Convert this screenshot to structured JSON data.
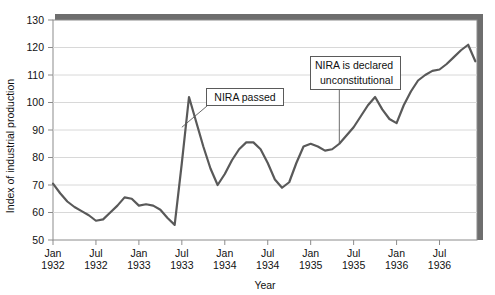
{
  "chart_data": {
    "type": "line",
    "title": "",
    "xlabel": "Year",
    "ylabel": "Index of industrial production",
    "ylim": [
      50,
      130
    ],
    "yticks": [
      50,
      60,
      70,
      80,
      90,
      100,
      110,
      120,
      130
    ],
    "grid": true,
    "legend": "none",
    "xtick_labels": [
      {
        "line1": "Jan",
        "line2": "1932"
      },
      {
        "line1": "Jul",
        "line2": "1932"
      },
      {
        "line1": "Jan",
        "line2": "1933"
      },
      {
        "line1": "Jul",
        "line2": "1933"
      },
      {
        "line1": "Jan",
        "line2": "1934"
      },
      {
        "line1": "Jul",
        "line2": "1934"
      },
      {
        "line1": "Jan",
        "line2": "1935"
      },
      {
        "line1": "Jul",
        "line2": "1935"
      },
      {
        "line1": "Jan",
        "line2": "1936"
      },
      {
        "line1": "Jul",
        "line2": "1936"
      }
    ],
    "x": [
      "1932-01",
      "1932-02",
      "1932-03",
      "1932-04",
      "1932-05",
      "1932-06",
      "1932-07",
      "1932-08",
      "1932-09",
      "1932-10",
      "1932-11",
      "1932-12",
      "1933-01",
      "1933-02",
      "1933-03",
      "1933-04",
      "1933-05",
      "1933-06",
      "1933-07",
      "1933-08",
      "1933-09",
      "1933-10",
      "1933-11",
      "1933-12",
      "1934-01",
      "1934-02",
      "1934-03",
      "1934-04",
      "1934-05",
      "1934-06",
      "1934-07",
      "1934-08",
      "1934-09",
      "1934-10",
      "1934-11",
      "1934-12",
      "1935-01",
      "1935-02",
      "1935-03",
      "1935-04",
      "1935-05",
      "1935-06",
      "1935-07",
      "1935-08",
      "1935-09",
      "1935-10",
      "1935-11",
      "1935-12",
      "1936-01",
      "1936-02",
      "1936-03",
      "1936-04",
      "1936-05",
      "1936-06",
      "1936-07",
      "1936-08",
      "1936-09",
      "1936-10",
      "1936-11",
      "1936-12"
    ],
    "values": [
      70.5,
      67.0,
      64.0,
      62.0,
      60.5,
      59.0,
      57.0,
      57.5,
      60.0,
      62.5,
      65.5,
      65.0,
      62.5,
      63.0,
      62.5,
      61.0,
      58.0,
      55.5,
      78.0,
      102.0,
      93.0,
      84.0,
      76.0,
      70.0,
      74.0,
      79.0,
      83.0,
      85.5,
      85.5,
      83.0,
      78.0,
      72.0,
      69.0,
      71.0,
      78.0,
      84.0,
      85.0,
      84.0,
      82.5,
      83.0,
      85.0,
      88.0,
      91.0,
      95.0,
      99.0,
      102.0,
      97.5,
      94.0,
      92.5,
      99.0,
      104.0,
      108.0,
      110.0,
      111.5,
      112.0,
      114.0,
      116.5,
      119.0,
      121.0,
      115.0
    ],
    "annotations": [
      {
        "id": "nira-passed",
        "text": "NIRA passed",
        "lines": [
          "NIRA passed"
        ],
        "target_x": "1933-07",
        "target_y": 91
      },
      {
        "id": "nira-unconstitutional",
        "text": "NIRA is declared unconstitutional",
        "lines": [
          "NIRA is declared",
          "unconstitutional"
        ],
        "target_x": "1935-05",
        "target_y": 85
      }
    ],
    "colors": {
      "line": "#595959",
      "grid": "#d8d8d8",
      "axis": "#8c8c8c",
      "box_shadow": "#6e6e6e",
      "annotation_border": "#5a5a5a",
      "text": "#111111"
    }
  }
}
